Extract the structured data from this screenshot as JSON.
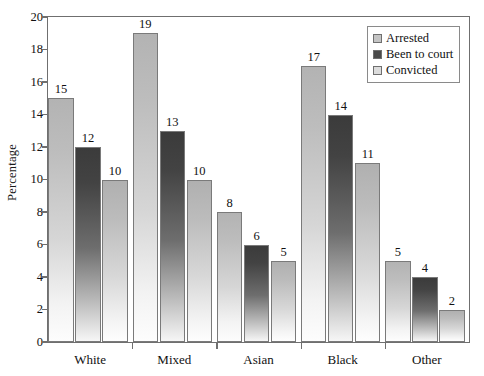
{
  "chart_data": {
    "type": "bar",
    "title": "",
    "subtitle": "",
    "xlabel": "",
    "ylabel": "Percentage",
    "ylim": [
      0,
      20
    ],
    "ytick_step": 2,
    "yticks": [
      0,
      2,
      4,
      6,
      8,
      10,
      12,
      14,
      16,
      18,
      20
    ],
    "categories": [
      "White",
      "Mixed",
      "Asian",
      "Black",
      "Other"
    ],
    "grid": false,
    "legend_position": "top-right",
    "series": [
      {
        "name": "Arrested",
        "values": [
          15,
          19,
          8,
          17,
          5
        ],
        "color": "#b3b3b3"
      },
      {
        "name": "Been to court",
        "values": [
          12,
          13,
          6,
          14,
          4
        ],
        "color": "#3b3b3b"
      },
      {
        "name": "Convicted",
        "values": [
          10,
          10,
          5,
          11,
          2
        ],
        "color": "#b0b0b0"
      }
    ],
    "value_labels_shown": true
  },
  "legend": {
    "items": [
      {
        "label": "Arrested",
        "swatch": "light"
      },
      {
        "label": "Been to court",
        "swatch": "dark"
      },
      {
        "label": "Convicted",
        "swatch": "mid"
      }
    ]
  },
  "axis": {
    "y_title": "Percentage"
  }
}
